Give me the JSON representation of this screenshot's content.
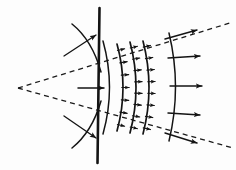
{
  "figure": {
    "title": "Wavefront propagation through an aperture",
    "background_color": "#fdfdfd",
    "ink_color": "#141414",
    "width": 236,
    "height": 170,
    "barrier": {
      "label": "aperture-plane-line",
      "x_top": 99.5,
      "y_top": 8,
      "x_bottom": 97.5,
      "y_bottom": 163,
      "stroke_width": 2.6
    },
    "focus_point": {
      "label": "virtual-source-vertex",
      "x": 18,
      "y": 88
    },
    "cone_rays": [
      {
        "name": "upper-divergence-ray",
        "x1": 18,
        "y1": 88,
        "x2": 233,
        "y2": 22,
        "dash": "5 4",
        "stroke_width": 1.3
      },
      {
        "name": "lower-divergence-ray",
        "x1": 18,
        "y1": 88,
        "x2": 233,
        "y2": 148,
        "dash": "5 4",
        "stroke_width": 1.3
      }
    ],
    "wavefronts": [
      {
        "name": "wavefront-0-at-aperture",
        "mid_x": 104,
        "top_y": 41,
        "bottom_y": 134,
        "bulge": 9,
        "stroke_width": 1.5,
        "ticks": 0
      },
      {
        "name": "wavefront-1",
        "mid_x": 118,
        "top_y": 44,
        "bottom_y": 131,
        "bulge": 8,
        "stroke_width": 1.7,
        "ticks": 7
      },
      {
        "name": "wavefront-2",
        "mid_x": 131,
        "top_y": 42,
        "bottom_y": 133,
        "bulge": 8,
        "stroke_width": 1.7,
        "ticks": 8
      },
      {
        "name": "wavefront-3",
        "mid_x": 144,
        "top_y": 41,
        "bottom_y": 134,
        "bulge": 8,
        "stroke_width": 1.7,
        "ticks": 8
      },
      {
        "name": "wavefront-4-outer",
        "mid_x": 170,
        "top_y": 33,
        "bottom_y": 141,
        "bulge": 9,
        "stroke_width": 1.5,
        "ticks": 0
      }
    ],
    "propagation_arrows": [
      {
        "name": "central-propagation-arrow",
        "x1": 78,
        "y1": 88,
        "x2": 104,
        "y2": 88,
        "angle_deg": 0,
        "stroke_width": 1.5
      },
      {
        "name": "outer-arrow-top-oblique",
        "x1": 165,
        "y1": 39,
        "x2": 197,
        "y2": 30,
        "angle_deg": -16,
        "stroke_width": 1.4
      },
      {
        "name": "outer-arrow-upper",
        "x1": 168,
        "y1": 58,
        "x2": 200,
        "y2": 56,
        "angle_deg": -4,
        "stroke_width": 1.4
      },
      {
        "name": "outer-arrow-middle",
        "x1": 170,
        "y1": 86,
        "x2": 202,
        "y2": 86,
        "angle_deg": 0,
        "stroke_width": 1.4
      },
      {
        "name": "outer-arrow-lower",
        "x1": 168,
        "y1": 113,
        "x2": 200,
        "y2": 115,
        "angle_deg": 4,
        "stroke_width": 1.4
      },
      {
        "name": "outer-arrow-bottom-oblique",
        "x1": 165,
        "y1": 133,
        "x2": 197,
        "y2": 143,
        "angle_deg": 16,
        "stroke_width": 1.4
      }
    ],
    "blocked_arcs": [
      {
        "name": "blocked-wave-arc-upper",
        "path": "M 72 24 Q 92 40 101 72",
        "arrow_x1": 64,
        "arrow_y1": 56,
        "arrow_x2": 96,
        "arrow_y2": 35,
        "stroke_width": 1.5
      },
      {
        "name": "blocked-wave-arc-lower",
        "path": "M 72 148 Q 92 132 101 101",
        "arrow_x1": 64,
        "arrow_y1": 116,
        "arrow_x2": 96,
        "arrow_y2": 138,
        "stroke_width": 1.5
      }
    ]
  }
}
